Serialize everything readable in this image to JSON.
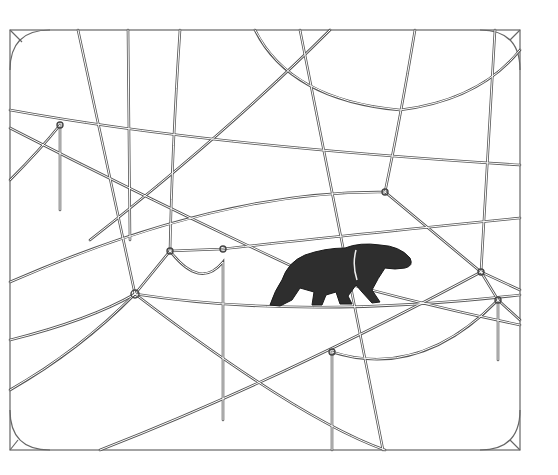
{
  "illustration": {
    "subject": "tapir-like animal walking on a rope within a web of strings",
    "style": "pen-and-ink line drawing",
    "frame": {
      "x": 10,
      "y": 30,
      "width": 510,
      "height": 420,
      "corner_radius": 38
    },
    "colors": {
      "background": "#ffffff",
      "ink": "#555555",
      "animal": "#2e2e2e"
    },
    "animal": {
      "name": "tapir",
      "position": {
        "x": 268,
        "y": 243
      },
      "direction": "right"
    },
    "knots": [
      {
        "x": 60,
        "y": 125
      },
      {
        "x": 135,
        "y": 294
      },
      {
        "x": 170,
        "y": 251
      },
      {
        "x": 223,
        "y": 249
      },
      {
        "x": 385,
        "y": 192
      },
      {
        "x": 481,
        "y": 272
      },
      {
        "x": 498,
        "y": 300
      },
      {
        "x": 332,
        "y": 352
      }
    ]
  }
}
